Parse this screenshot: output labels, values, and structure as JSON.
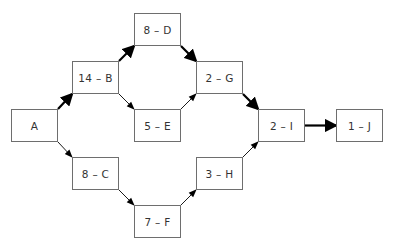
{
  "diagram": {
    "type": "network-diagram",
    "nodes": [
      {
        "id": "A",
        "label": "A",
        "x": 11,
        "y": 109,
        "w": 47,
        "h": 33
      },
      {
        "id": "B",
        "label": "14 – B",
        "x": 72,
        "y": 61,
        "w": 47,
        "h": 33
      },
      {
        "id": "C",
        "label": "8 – C",
        "x": 72,
        "y": 157,
        "w": 47,
        "h": 33
      },
      {
        "id": "D",
        "label": "8 – D",
        "x": 134,
        "y": 13,
        "w": 47,
        "h": 33
      },
      {
        "id": "E",
        "label": "5 – E",
        "x": 134,
        "y": 109,
        "w": 47,
        "h": 33
      },
      {
        "id": "F",
        "label": "7 – F",
        "x": 134,
        "y": 205,
        "w": 47,
        "h": 33
      },
      {
        "id": "G",
        "label": "2 – G",
        "x": 196,
        "y": 61,
        "w": 47,
        "h": 33
      },
      {
        "id": "H",
        "label": "3 – H",
        "x": 196,
        "y": 157,
        "w": 47,
        "h": 33
      },
      {
        "id": "I",
        "label": "2 – I",
        "x": 258,
        "y": 109,
        "w": 47,
        "h": 33
      },
      {
        "id": "J",
        "label": "1 – J",
        "x": 336,
        "y": 109,
        "w": 47,
        "h": 33
      }
    ],
    "edges": [
      {
        "from": "A",
        "to": "B",
        "critical": true
      },
      {
        "from": "A",
        "to": "C",
        "critical": false
      },
      {
        "from": "B",
        "to": "D",
        "critical": true
      },
      {
        "from": "B",
        "to": "E",
        "critical": false
      },
      {
        "from": "D",
        "to": "G",
        "critical": true
      },
      {
        "from": "E",
        "to": "G",
        "critical": false
      },
      {
        "from": "C",
        "to": "F",
        "critical": false
      },
      {
        "from": "F",
        "to": "H",
        "critical": false
      },
      {
        "from": "G",
        "to": "I",
        "critical": true
      },
      {
        "from": "H",
        "to": "I",
        "critical": false
      },
      {
        "from": "I",
        "to": "J",
        "critical": true
      }
    ],
    "colors": {
      "border": "#6e6e6e",
      "text": "#333333",
      "arrow": "#000000"
    }
  }
}
